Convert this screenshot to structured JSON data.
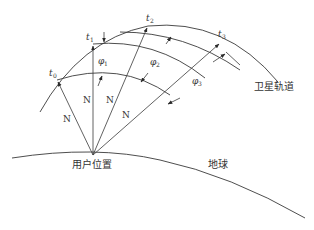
{
  "diagram": {
    "title": "",
    "labels": {
      "orbit": "卫星轨道",
      "earth": "地球",
      "user": "用户位置",
      "t0": "t",
      "t0_sub": "0",
      "t1": "t",
      "t1_sub": "1",
      "t2": "t",
      "t2_sub": "2",
      "t3": "t",
      "t3_sub": "3",
      "phi1": "φ",
      "phi1_sub": "1",
      "phi2": "φ",
      "phi2_sub": "2",
      "phi3": "φ",
      "phi3_sub": "3",
      "n1": "N",
      "n2": "N",
      "n3": "N",
      "n4": "N"
    },
    "colors": {
      "stroke": "#3a3a3a",
      "text": "#333333",
      "background": "#ffffff"
    }
  }
}
